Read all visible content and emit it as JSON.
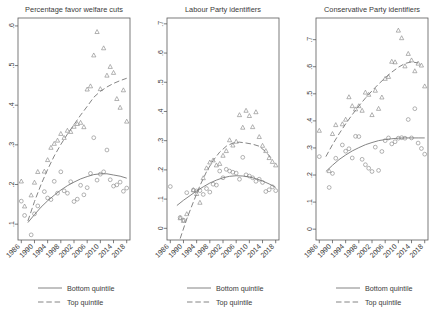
{
  "figure": {
    "panel_count": 3,
    "marker_bottom": "circle",
    "marker_top": "triangle",
    "line_color": "#777777",
    "marker_color": "#8a8a8a",
    "axis_color": "#5b5b5b",
    "background": "#ffffff"
  },
  "legend": {
    "bottom_label": "Bottom quintile",
    "top_label": "Top quintile",
    "bottom_style": "solid",
    "top_style": "dashed"
  },
  "chart_data": [
    {
      "type": "scatter",
      "title": "Percentage favor welfare cuts",
      "xlabel": "",
      "ylabel": "",
      "xlim": [
        1985,
        2019
      ],
      "ylim": [
        0.06,
        0.62
      ],
      "xticks": [
        1986,
        1990,
        1994,
        1998,
        2002,
        2006,
        2010,
        2014,
        2018
      ],
      "xticklabels": [
        "1986",
        "1990",
        "1994",
        "1998",
        "2002",
        "2006",
        "2010",
        "2014",
        "2018"
      ],
      "yticks": [
        0.1,
        0.2,
        0.3,
        0.4,
        0.5,
        0.6
      ],
      "yticklabels": [
        ".1",
        ".2",
        ".3",
        ".4",
        ".5",
        ".6"
      ],
      "grid": false,
      "legend_position": "below",
      "series": [
        {
          "name": "Bottom quintile",
          "marker": "circle",
          "line": "solid",
          "x": [
            1986,
            1987,
            1989,
            1990,
            1991,
            1993,
            1994,
            1995,
            1996,
            1997,
            1998,
            1999,
            2000,
            2001,
            2002,
            2003,
            2004,
            2005,
            2006,
            2007,
            2008,
            2009,
            2010,
            2011,
            2012,
            2013,
            2014,
            2015,
            2016,
            2017,
            2018
          ],
          "y": [
            0.158,
            0.122,
            0.073,
            0.126,
            0.146,
            0.182,
            0.166,
            0.162,
            0.208,
            0.178,
            0.232,
            0.184,
            0.178,
            0.207,
            0.157,
            0.163,
            0.198,
            0.174,
            0.192,
            0.228,
            0.318,
            0.211,
            0.226,
            0.232,
            0.287,
            0.212,
            0.196,
            0.199,
            0.206,
            0.183,
            0.191
          ],
          "fit_x": [
            1988,
            1990,
            1992,
            1994,
            1996,
            1998,
            2000,
            2002,
            2004,
            2006,
            2008,
            2010,
            2012,
            2014,
            2016,
            2018
          ],
          "fit_y": [
            0.104,
            0.124,
            0.143,
            0.159,
            0.173,
            0.186,
            0.197,
            0.206,
            0.214,
            0.22,
            0.225,
            0.227,
            0.227,
            0.224,
            0.221,
            0.216
          ]
        },
        {
          "name": "Top quintile",
          "marker": "triangle",
          "line": "dashed",
          "x": [
            1986,
            1987,
            1989,
            1990,
            1991,
            1993,
            1994,
            1995,
            1996,
            1997,
            1998,
            1999,
            2000,
            2001,
            2002,
            2003,
            2004,
            2005,
            2006,
            2007,
            2008,
            2009,
            2010,
            2011,
            2012,
            2013,
            2014,
            2015,
            2016,
            2017,
            2018
          ],
          "y": [
            0.208,
            0.145,
            0.173,
            0.205,
            0.232,
            0.233,
            0.262,
            0.293,
            0.303,
            0.311,
            0.328,
            0.318,
            0.336,
            0.333,
            0.346,
            0.353,
            0.356,
            0.345,
            0.44,
            0.448,
            0.526,
            0.585,
            0.441,
            0.544,
            0.475,
            0.497,
            0.482,
            0.416,
            0.394,
            0.438,
            0.359
          ],
          "fit_x": [
            1988,
            1990,
            1992,
            1994,
            1996,
            1998,
            2000,
            2002,
            2004,
            2006,
            2008,
            2010,
            2012,
            2014,
            2016,
            2018
          ],
          "fit_y": [
            0.108,
            0.157,
            0.2,
            0.238,
            0.272,
            0.301,
            0.327,
            0.351,
            0.375,
            0.397,
            0.42,
            0.435,
            0.446,
            0.455,
            0.462,
            0.468
          ]
        }
      ]
    },
    {
      "type": "scatter",
      "title": "Labour Party identifiers",
      "xlabel": "",
      "ylabel": "",
      "xlim": [
        1985,
        2019
      ],
      "ylim": [
        -0.04,
        0.72
      ],
      "xticks": [
        1986,
        1990,
        1994,
        1998,
        2002,
        2006,
        2010,
        2014,
        2018
      ],
      "xticklabels": [
        "1986",
        "1990",
        "1994",
        "1998",
        "2002",
        "2006",
        "2010",
        "2014",
        "2018"
      ],
      "yticks": [
        0,
        0.1,
        0.2,
        0.3,
        0.4,
        0.5,
        0.6,
        0.7
      ],
      "yticklabels": [
        "0",
        ".1",
        ".2",
        ".3",
        ".4",
        ".5",
        ".6",
        ".7"
      ],
      "grid": false,
      "legend_position": "below",
      "series": [
        {
          "name": "Bottom quintile",
          "marker": "circle",
          "line": "solid",
          "x": [
            1986,
            1989,
            1990,
            1991,
            1993,
            1994,
            1995,
            1996,
            1997,
            1998,
            1999,
            2000,
            2001,
            2002,
            2003,
            2004,
            2005,
            2006,
            2007,
            2008,
            2009,
            2010,
            2011,
            2012,
            2013,
            2014,
            2015,
            2016,
            2017,
            2018
          ],
          "y": [
            0.143,
            0.037,
            0.028,
            0.122,
            0.131,
            0.128,
            0.129,
            0.116,
            0.136,
            0.124,
            0.151,
            0.148,
            0.196,
            0.173,
            0.202,
            0.196,
            0.192,
            0.189,
            0.168,
            0.243,
            0.183,
            0.179,
            0.173,
            0.161,
            0.168,
            0.157,
            0.126,
            0.132,
            0.142,
            0.129
          ],
          "fit_x": [
            1988,
            1990,
            1992,
            1994,
            1996,
            1998,
            2000,
            2002,
            2004,
            2006,
            2008,
            2010,
            2012,
            2014,
            2016,
            2018
          ],
          "fit_y": [
            0.078,
            0.096,
            0.112,
            0.128,
            0.142,
            0.155,
            0.165,
            0.173,
            0.178,
            0.18,
            0.179,
            0.176,
            0.17,
            0.162,
            0.152,
            0.14
          ]
        },
        {
          "name": "Top quintile",
          "marker": "triangle",
          "line": "dashed",
          "x": [
            1989,
            1990,
            1991,
            1993,
            1994,
            1995,
            1996,
            1997,
            1998,
            1999,
            2000,
            2001,
            2002,
            2003,
            2004,
            2005,
            2006,
            2007,
            2008,
            2009,
            2010,
            2011,
            2012,
            2013,
            2014,
            2015,
            2016,
            2017,
            2018
          ],
          "y": [
            0.035,
            0.026,
            0.049,
            0.131,
            0.118,
            0.088,
            0.172,
            0.206,
            0.226,
            0.233,
            0.216,
            0.221,
            0.249,
            0.265,
            0.302,
            0.284,
            0.297,
            0.388,
            0.345,
            0.403,
            0.385,
            0.347,
            0.398,
            0.313,
            0.283,
            0.265,
            0.241,
            0.228,
            0.216
          ],
          "fit_x": [
            1989,
            1991,
            1993,
            1995,
            1997,
            1999,
            2001,
            2003,
            2005,
            2007,
            2009,
            2011,
            2013,
            2015,
            2017
          ],
          "fit_y": [
            -0.035,
            0.032,
            0.09,
            0.146,
            0.194,
            0.232,
            0.261,
            0.281,
            0.292,
            0.295,
            0.292,
            0.288,
            0.281,
            0.262,
            0.236
          ]
        }
      ]
    },
    {
      "type": "scatter",
      "title": "Conservative Party identifiers",
      "xlabel": "",
      "ylabel": "",
      "xlim": [
        1985,
        2019
      ],
      "ylim": [
        -0.04,
        0.78
      ],
      "xticks": [
        1986,
        1990,
        1994,
        1998,
        2002,
        2006,
        2010,
        2014,
        2018
      ],
      "xticklabels": [
        "1986",
        "1990",
        "1994",
        "1998",
        "2002",
        "2006",
        "2010",
        "2014",
        "2018"
      ],
      "yticks": [
        0,
        0.1,
        0.2,
        0.3,
        0.4,
        0.5,
        0.6,
        0.7
      ],
      "yticklabels": [
        "0",
        ".1",
        ".2",
        ".3",
        ".4",
        ".5",
        ".6",
        ".7"
      ],
      "grid": false,
      "legend_position": "below",
      "series": [
        {
          "name": "Bottom quintile",
          "marker": "circle",
          "line": "solid",
          "x": [
            1986,
            1989,
            1990,
            1991,
            1993,
            1994,
            1995,
            1996,
            1997,
            1998,
            1999,
            2000,
            2001,
            2002,
            2003,
            2004,
            2005,
            2006,
            2007,
            2008,
            2009,
            2010,
            2011,
            2012,
            2013,
            2014,
            2015,
            2016,
            2017,
            2018
          ],
          "y": [
            0.268,
            0.154,
            0.206,
            0.262,
            0.311,
            0.288,
            0.297,
            0.263,
            0.343,
            0.342,
            0.258,
            0.238,
            0.225,
            0.213,
            0.303,
            0.217,
            0.287,
            0.327,
            0.337,
            0.315,
            0.323,
            0.336,
            0.338,
            0.336,
            0.405,
            0.337,
            0.445,
            0.318,
            0.298,
            0.277
          ],
          "fit_x": [
            1988,
            1990,
            1992,
            1994,
            1996,
            1998,
            2000,
            2002,
            2004,
            2006,
            2008,
            2010,
            2012,
            2014,
            2016,
            2018
          ],
          "fit_y": [
            0.213,
            0.236,
            0.257,
            0.274,
            0.289,
            0.301,
            0.312,
            0.32,
            0.327,
            0.331,
            0.334,
            0.336,
            0.337,
            0.337,
            0.337,
            0.337
          ]
        },
        {
          "name": "Top quintile",
          "marker": "triangle",
          "line": "dashed",
          "x": [
            1986,
            1989,
            1990,
            1991,
            1993,
            1994,
            1995,
            1996,
            1997,
            1998,
            1999,
            2000,
            2001,
            2002,
            2003,
            2004,
            2005,
            2006,
            2007,
            2008,
            2009,
            2010,
            2011,
            2012,
            2013,
            2014,
            2015,
            2016,
            2017,
            2018
          ],
          "y": [
            0.364,
            0.215,
            0.352,
            0.385,
            0.388,
            0.405,
            0.488,
            0.455,
            0.443,
            0.455,
            0.438,
            0.505,
            0.497,
            0.422,
            0.512,
            0.445,
            0.487,
            0.556,
            0.563,
            0.619,
            0.617,
            0.734,
            0.706,
            0.602,
            0.648,
            0.624,
            0.584,
            0.612,
            0.605,
            0.528
          ],
          "fit_x": [
            1988,
            1990,
            1992,
            1994,
            1996,
            1998,
            2000,
            2002,
            2004,
            2006,
            2008,
            2010,
            2012,
            2014,
            2016
          ],
          "fit_y": [
            0.268,
            0.312,
            0.352,
            0.389,
            0.423,
            0.455,
            0.484,
            0.511,
            0.536,
            0.559,
            0.58,
            0.598,
            0.612,
            0.618,
            0.614
          ]
        }
      ]
    }
  ]
}
